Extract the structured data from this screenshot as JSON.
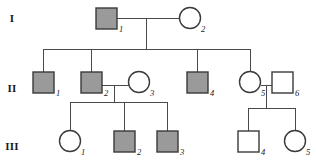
{
  "diagram": {
    "colors": {
      "affected_fill": "#9a9a9a",
      "unaffected_fill": "#ffffff",
      "stroke": "#3a3a3a",
      "line": "#4a4a4a",
      "background": "#ffffff",
      "text": "#1a1a1a"
    },
    "generation_labels": [
      {
        "key": "I",
        "text": "I",
        "x": 12,
        "y": 22
      },
      {
        "key": "II",
        "text": "II",
        "x": 12,
        "y": 92
      },
      {
        "key": "III",
        "text": "III",
        "x": 12,
        "y": 150
      }
    ],
    "individuals": [
      {
        "id": "I-1",
        "generation": "I",
        "number": "1",
        "sex": "male",
        "shape": "square",
        "affected": true,
        "x": 96,
        "y": 8,
        "size": 21,
        "label_x": 119,
        "label_y": 32
      },
      {
        "id": "I-2",
        "generation": "I",
        "number": "2",
        "sex": "female",
        "shape": "circle",
        "affected": false,
        "cx": 190,
        "cy": 18,
        "r": 10.5,
        "label_x": 201,
        "label_y": 32
      },
      {
        "id": "II-1",
        "generation": "II",
        "number": "1",
        "sex": "male",
        "shape": "square",
        "affected": true,
        "x": 33,
        "y": 72,
        "size": 21,
        "label_x": 56,
        "label_y": 96
      },
      {
        "id": "II-2",
        "generation": "II",
        "number": "2",
        "sex": "male",
        "shape": "square",
        "affected": true,
        "x": 81,
        "y": 72,
        "size": 21,
        "label_x": 104,
        "label_y": 96
      },
      {
        "id": "II-3",
        "generation": "II",
        "number": "3",
        "sex": "female",
        "shape": "circle",
        "affected": false,
        "cx": 139,
        "cy": 82,
        "r": 10.5,
        "label_x": 150,
        "label_y": 96
      },
      {
        "id": "II-4",
        "generation": "II",
        "number": "4",
        "sex": "male",
        "shape": "square",
        "affected": true,
        "x": 187,
        "y": 72,
        "size": 21,
        "label_x": 210,
        "label_y": 96
      },
      {
        "id": "II-5",
        "generation": "II",
        "number": "5",
        "sex": "female",
        "shape": "circle",
        "affected": false,
        "cx": 250,
        "cy": 82,
        "r": 10.5,
        "label_x": 261,
        "label_y": 96
      },
      {
        "id": "II-6",
        "generation": "II",
        "number": "6",
        "sex": "male",
        "shape": "square",
        "affected": false,
        "x": 272,
        "y": 72,
        "size": 21,
        "label_x": 295,
        "label_y": 96
      },
      {
        "id": "III-1",
        "generation": "III",
        "number": "1",
        "sex": "female",
        "shape": "circle",
        "affected": false,
        "cx": 70,
        "cy": 141,
        "r": 10.5,
        "label_x": 81,
        "label_y": 155
      },
      {
        "id": "III-2",
        "generation": "III",
        "number": "2",
        "sex": "male",
        "shape": "square",
        "affected": true,
        "x": 114,
        "y": 131,
        "size": 21,
        "label_x": 137,
        "label_y": 155
      },
      {
        "id": "III-3",
        "generation": "III",
        "number": "3",
        "sex": "male",
        "shape": "square",
        "affected": true,
        "x": 157,
        "y": 131,
        "size": 21,
        "label_x": 180,
        "label_y": 155
      },
      {
        "id": "III-4",
        "generation": "III",
        "number": "4",
        "sex": "male",
        "shape": "square",
        "affected": false,
        "x": 238,
        "y": 131,
        "size": 21,
        "label_x": 261,
        "label_y": 155
      },
      {
        "id": "III-5",
        "generation": "III",
        "number": "5",
        "sex": "female",
        "shape": "circle",
        "affected": false,
        "cx": 295,
        "cy": 141,
        "r": 10.5,
        "label_x": 306,
        "label_y": 155
      }
    ],
    "connectors": [
      {
        "name": "mating-line-I1-I2",
        "points": "117,18 179.5,18"
      },
      {
        "name": "descent-line-I",
        "points": "146,18 146,49"
      },
      {
        "name": "sibship-line-II",
        "points": "43,49 250,49"
      },
      {
        "name": "drop-line-II-1",
        "points": "43,49 43,72"
      },
      {
        "name": "drop-line-II-2",
        "points": "91,49 91,72"
      },
      {
        "name": "drop-line-II-4",
        "points": "197,49 197,72"
      },
      {
        "name": "drop-line-II-5",
        "points": "250,49 250,71.5"
      },
      {
        "name": "mating-line-II2-II3",
        "points": "102,85 128.5,85"
      },
      {
        "name": "descent-line-II2-II3",
        "points": "114,85 114,102"
      },
      {
        "name": "sibship-line-III-left",
        "points": "70,102 167,102"
      },
      {
        "name": "drop-line-III-1",
        "points": "70,102 70,130.5"
      },
      {
        "name": "drop-line-III-2",
        "points": "124,102 124,131"
      },
      {
        "name": "drop-line-III-3",
        "points": "167,102 167,131"
      },
      {
        "name": "mating-line-II5-II6",
        "points": "260.5,85 272,85"
      },
      {
        "name": "descent-line-II5-II6",
        "points": "266,85 266,108"
      },
      {
        "name": "sibship-line-III-right",
        "points": "248,108 295,108"
      },
      {
        "name": "drop-line-III-4",
        "points": "248,108 248,131"
      },
      {
        "name": "drop-line-III-5",
        "points": "295,108 295,130.5"
      }
    ]
  }
}
